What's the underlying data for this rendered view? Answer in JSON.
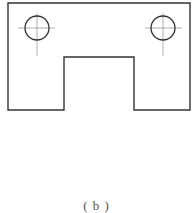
{
  "diagram": {
    "type": "engineering-drawing",
    "caption": "( b )",
    "colors": {
      "outline": "#333333",
      "centerline": "#999999",
      "background": "#ffffff"
    },
    "plate": {
      "outline_points": "8,3 190,3 190,110 134,110 134,57 64,57 64,110 8,110"
    },
    "holes": [
      {
        "cx": 37,
        "cy": 28,
        "r": 12,
        "centerline_h": [
          18,
          55
        ],
        "centerline_v": [
          13,
          56
        ]
      },
      {
        "cx": 163,
        "cy": 28,
        "r": 12,
        "centerline_h": [
          145,
          182
        ],
        "centerline_v": [
          13,
          56
        ]
      }
    ]
  }
}
